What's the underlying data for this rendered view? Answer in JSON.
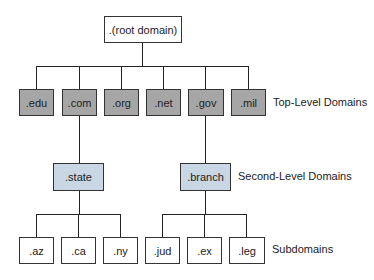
{
  "diagram": {
    "root": {
      "label": ".(root domain)"
    },
    "top_level": [
      {
        "label": ".edu"
      },
      {
        "label": ".com"
      },
      {
        "label": ".org"
      },
      {
        "label": ".net"
      },
      {
        "label": ".gov"
      },
      {
        "label": ".mil"
      }
    ],
    "second_level": [
      {
        "label": ".state",
        "parent": ".com"
      },
      {
        "label": ".branch",
        "parent": ".gov"
      }
    ],
    "subdomains": [
      {
        "label": ".az",
        "parent": ".state"
      },
      {
        "label": ".ca",
        "parent": ".state"
      },
      {
        "label": ".ny",
        "parent": ".state"
      },
      {
        "label": ".jud",
        "parent": ".branch"
      },
      {
        "label": ".ex",
        "parent": ".branch"
      },
      {
        "label": ".leg",
        "parent": ".branch"
      }
    ],
    "level_labels": {
      "top_level": "Top-Level Domains",
      "second_level": "Second-Level Domains",
      "subdomains": "Subdomains"
    },
    "colors": {
      "top_level_fill": "#a6a6a6",
      "second_level_fill": "#c9d6e3",
      "root_fill": "#ffffff",
      "subdomain_fill": "#ffffff"
    }
  }
}
